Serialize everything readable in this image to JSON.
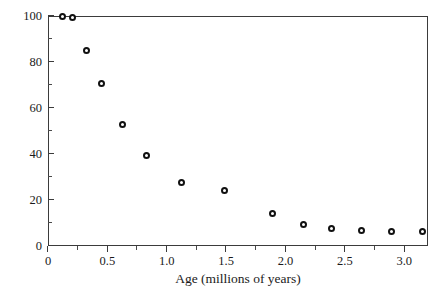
{
  "chart_data": {
    "type": "scatter",
    "title": "",
    "xlabel": "Age (millions of years)",
    "ylabel": "Extant Species (percentage)",
    "xlim": [
      0,
      3.2
    ],
    "ylim": [
      0,
      100
    ],
    "grid": false,
    "legend": null,
    "marker": "open-circle",
    "x_ticks": [
      0,
      0.5,
      1.0,
      1.5,
      2.0,
      2.5,
      3.0
    ],
    "x_tick_labels": [
      "0",
      "0.5",
      "1.0",
      "1.5",
      "2.0",
      "2.5",
      "3.0"
    ],
    "x_minor_ticks": [
      0.25,
      0.75,
      1.25,
      1.75,
      2.25,
      2.75
    ],
    "y_ticks": [
      0,
      20,
      40,
      60,
      80,
      100
    ],
    "y_tick_labels": [
      "0",
      "20",
      "40",
      "60",
      "80",
      "100"
    ],
    "y_minor_ticks": [
      10,
      30,
      50,
      70,
      90
    ],
    "points": [
      {
        "x": 0.12,
        "y": 100.0
      },
      {
        "x": 0.21,
        "y": 99.5
      },
      {
        "x": 0.32,
        "y": 85.0
      },
      {
        "x": 0.45,
        "y": 70.6
      },
      {
        "x": 0.63,
        "y": 53.0
      },
      {
        "x": 0.83,
        "y": 39.5
      },
      {
        "x": 1.12,
        "y": 27.4
      },
      {
        "x": 1.49,
        "y": 24.0
      },
      {
        "x": 1.89,
        "y": 14.0
      },
      {
        "x": 2.15,
        "y": 9.2
      },
      {
        "x": 2.39,
        "y": 7.5
      },
      {
        "x": 2.64,
        "y": 6.8
      },
      {
        "x": 2.89,
        "y": 6.5
      },
      {
        "x": 3.15,
        "y": 6.3
      }
    ]
  },
  "colors": {
    "axis": "#3b3b3b",
    "marker_edge": "#111111",
    "marker_fill": "#ffffff",
    "text": "#1a1a1a",
    "background": "#ffffff"
  }
}
